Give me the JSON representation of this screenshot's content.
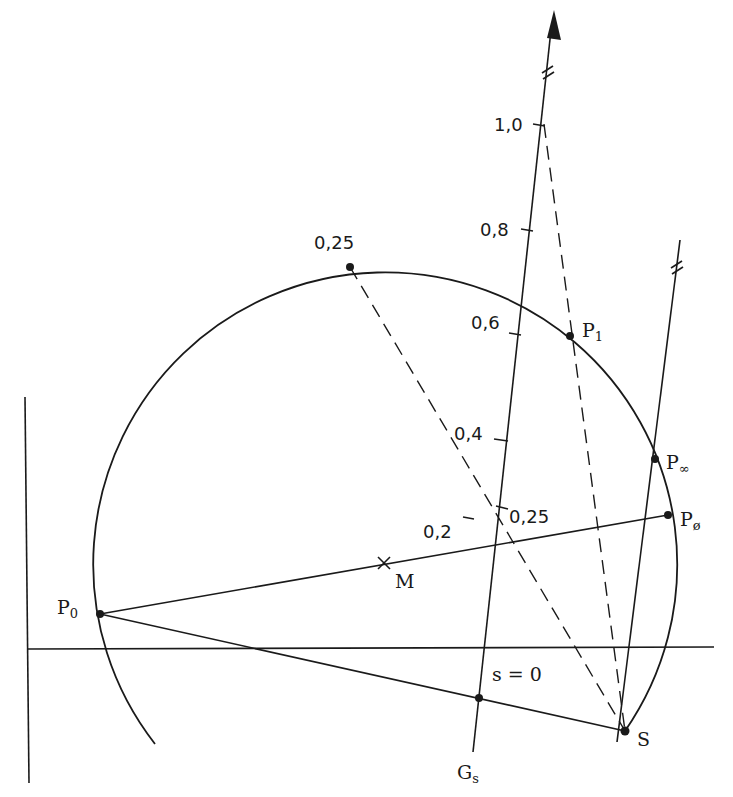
{
  "diagram": {
    "type": "circle diagram (Heyland/Ossanna circle) with slip scale line",
    "colors": {
      "ink": "#1a1a1a",
      "background": "#ffffff"
    },
    "points": {
      "P0": {
        "label": "P",
        "sub": "0"
      },
      "M": {
        "label": "M"
      },
      "P1": {
        "label": "P",
        "sub": "1"
      },
      "Pinf": {
        "label": "P",
        "sub": "∞"
      },
      "Pphi": {
        "label": "P",
        "sub": "ø"
      },
      "S": {
        "label": "S"
      },
      "circle_025": {
        "label": "0,25"
      }
    },
    "slip_line": {
      "name": {
        "label": "G",
        "sub": "s"
      },
      "zero": "s = 0",
      "ticks": [
        "0,2",
        "0,4",
        "0,6",
        "0,8",
        "1,0"
      ],
      "intersection": "0,25"
    }
  }
}
